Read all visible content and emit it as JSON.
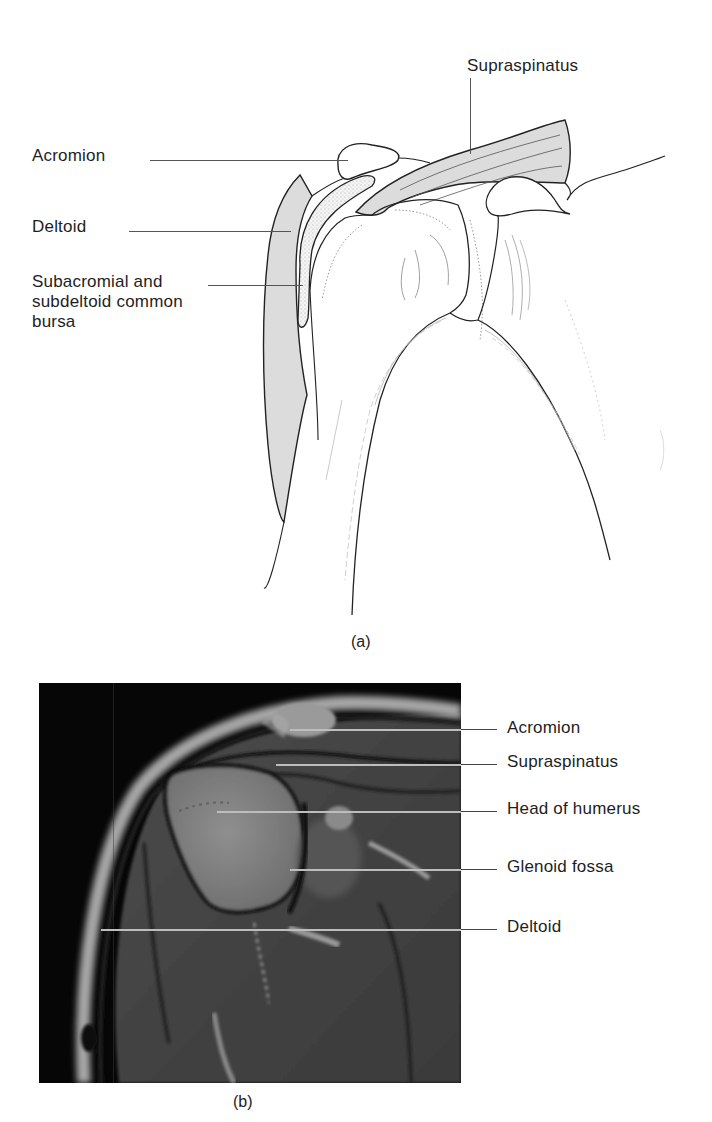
{
  "figure_a": {
    "caption": "(a)",
    "labels": {
      "supraspinatus": "Supraspinatus",
      "acromion": "Acromion",
      "deltoid": "Deltoid",
      "bursa": "Subacromial and\nsubdeltoid common\nbursa"
    }
  },
  "figure_b": {
    "caption": "(b)",
    "labels": {
      "acromion": "Acromion",
      "supraspinatus": "Supraspinatus",
      "head_of_humerus": "Head of humerus",
      "glenoid_fossa": "Glenoid fossa",
      "deltoid": "Deltoid"
    }
  },
  "colors": {
    "muscle_fill": "#d9d9d9",
    "line": "#222222",
    "mri_background": "#050505",
    "mri_leader": "#bdbdbd"
  }
}
